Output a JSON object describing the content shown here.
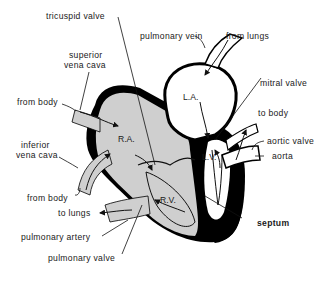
{
  "diagram": {
    "colors": {
      "muscle": "#000000",
      "deoxygenated": "#cfcfcf",
      "oxygenated": "#ffffff",
      "text": "#1a1a1a"
    },
    "chambers": {
      "ra": "R.A.",
      "rv": "R.V.",
      "la": "L.A.",
      "lv": "L.V."
    },
    "labels": {
      "tricuspid_valve": "tricuspid valve",
      "pulmonary_vein": "pulmonary vein",
      "from_lungs": "from lungs",
      "superior_vena_cava_1": "superior",
      "superior_vena_cava_2": "vena cava",
      "from_body_top": "from body",
      "mitral_valve": "mitral valve",
      "to_body": "to body",
      "inferior_vena_cava_1": "inferior",
      "inferior_vena_cava_2": "vena cava",
      "aortic_valve": "aortic valve",
      "aorta": "aorta",
      "from_body_bottom": "from body",
      "to_lungs": "to lungs",
      "septum": "septum",
      "pulmonary_artery": "pulmonary artery",
      "pulmonary_valve": "pulmonary valve"
    }
  }
}
